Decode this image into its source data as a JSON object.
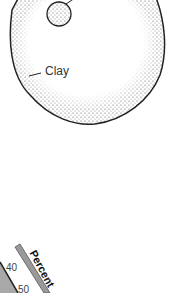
{
  "diagram": {
    "particle_labels": {
      "clay": "Clay"
    },
    "texture_triangle_fragment": {
      "axis_title": "Percent",
      "ticks": [
        "40",
        "50"
      ]
    },
    "colors": {
      "outline": "#222222",
      "stipple": "#555555",
      "axis_bar": "#9a9a9a",
      "triangle_fill": "#a8a8a8"
    }
  }
}
